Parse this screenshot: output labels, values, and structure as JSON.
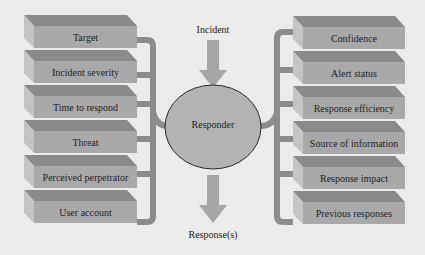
{
  "diagram": {
    "input_label": "Incident",
    "center_label": "Responder",
    "output_label": "Response(s)",
    "left_factors": [
      {
        "label": "Target"
      },
      {
        "label": "Incident severity"
      },
      {
        "label": "Time to respond"
      },
      {
        "label": "Threat"
      },
      {
        "label": "Perceived perpetrator"
      },
      {
        "label": "User account"
      }
    ],
    "right_factors": [
      {
        "label": "Confidence"
      },
      {
        "label": "Alert status"
      },
      {
        "label": "Response efficiency"
      },
      {
        "label": "Source of information"
      },
      {
        "label": "Response impact"
      },
      {
        "label": "Previous responses"
      }
    ],
    "colors": {
      "background": "#ebebe9",
      "box_front": "#a9a9a9",
      "box_top": "#8a8a8a",
      "box_side": "#c4c4c4",
      "connector": "#8c8c8c",
      "ellipse_fill": "#b3b3b3",
      "ellipse_stroke": "#2a2a2a",
      "arrow": "#a6a6a6"
    }
  }
}
